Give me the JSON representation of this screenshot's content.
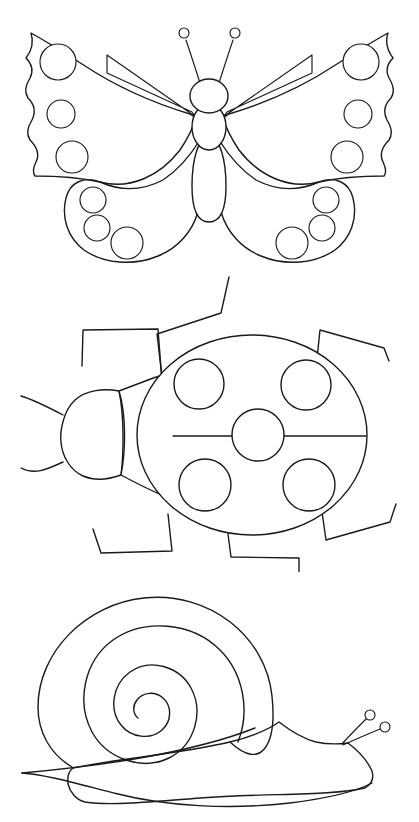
{
  "page": {
    "background_color": "#ffffff",
    "line_color": "#1a1a1a",
    "width": 419,
    "height": 822,
    "style": "black-and-white line art / coloring page",
    "figure_count": 3
  },
  "figures": [
    {
      "id": "butterfly",
      "label": "Butterfly",
      "bounds": {
        "x": 18,
        "y": 18,
        "width": 384,
        "height": 250
      },
      "parts": [
        {
          "name": "left-upper-wing",
          "spots": 3,
          "has_stripe": true
        },
        {
          "name": "right-upper-wing",
          "spots": 3,
          "has_stripe": true
        },
        {
          "name": "left-lower-wing",
          "spots": 3
        },
        {
          "name": "right-lower-wing",
          "spots": 3
        },
        {
          "name": "head",
          "shape": "circle"
        },
        {
          "name": "thorax",
          "shape": "oval"
        },
        {
          "name": "abdomen",
          "shape": "long-oval"
        },
        {
          "name": "left-antenna",
          "tip": "small circle"
        },
        {
          "name": "right-antenna",
          "tip": "small circle"
        }
      ],
      "total_spots": 12
    },
    {
      "id": "ladybug",
      "label": "Ladybug",
      "bounds": {
        "x": 12,
        "y": 280,
        "width": 395,
        "height": 280
      },
      "parts": [
        {
          "name": "head",
          "shape": "rounded"
        },
        {
          "name": "pronotum",
          "shape": "shield"
        },
        {
          "name": "body",
          "shape": "ellipse"
        },
        {
          "name": "center-line",
          "orientation": "horizontal"
        },
        {
          "name": "legs",
          "count": 6,
          "shape": "zigzag"
        },
        {
          "name": "antennae",
          "count": 2
        }
      ],
      "total_spots": 5
    },
    {
      "id": "snail",
      "label": "Snail",
      "bounds": {
        "x": 22,
        "y": 570,
        "width": 378,
        "height": 240
      },
      "parts": [
        {
          "name": "shell",
          "shape": "spiral",
          "turns": 2.5
        },
        {
          "name": "body",
          "shape": "curved"
        },
        {
          "name": "foot",
          "shape": "wavy base"
        },
        {
          "name": "left-tentacle",
          "tip": "small circle"
        },
        {
          "name": "right-tentacle",
          "tip": "small circle"
        }
      ],
      "total_spots": 0
    }
  ]
}
